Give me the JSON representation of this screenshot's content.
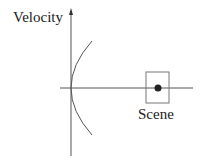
{
  "diagram": {
    "y_axis_label": "Velocity",
    "scene_label": "Scene",
    "colors": {
      "axis": "#555555",
      "curve": "#555555",
      "box": "#777777",
      "dot": "#222222",
      "text": "#222222"
    }
  }
}
